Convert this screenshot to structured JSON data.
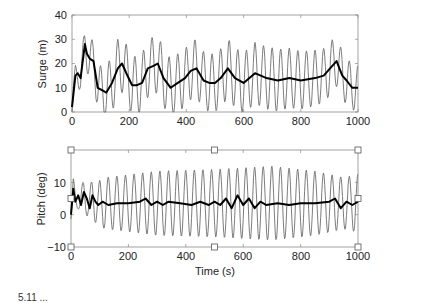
{
  "figure": {
    "caption_partial": "5.11  ..."
  },
  "chart_data": [
    {
      "type": "line",
      "title": "",
      "xlabel": "",
      "ylabel": "Surge (m)",
      "xlim": [
        0,
        1000
      ],
      "ylim": [
        0,
        40
      ],
      "xticks": [
        0,
        200,
        400,
        600,
        800,
        1000
      ],
      "yticks": [
        0,
        10,
        20,
        30,
        40
      ],
      "grid": false,
      "legend": null,
      "frame_px": {
        "left": 72,
        "top": 15,
        "right": 358,
        "bottom": 112
      },
      "series": [
        {
          "name": "surge (oscillatory, thin gray)",
          "color": "#6e6e6e",
          "width": 0.9,
          "kind": "oscillation",
          "period_s": 30,
          "amplitude_m": [
            [
              0,
              4
            ],
            [
              60,
              8
            ],
            [
              150,
              12
            ],
            [
              300,
              12
            ],
            [
              500,
              12
            ],
            [
              700,
              13
            ],
            [
              900,
              11
            ],
            [
              1000,
              9
            ]
          ]
        },
        {
          "name": "surge (mean, thick black)",
          "color": "#000000",
          "width": 2.0,
          "kind": "points",
          "x": [
            0,
            12,
            20,
            30,
            45,
            52,
            62,
            75,
            90,
            105,
            120,
            140,
            160,
            175,
            190,
            210,
            225,
            245,
            265,
            285,
            300,
            320,
            345,
            370,
            395,
            415,
            435,
            460,
            480,
            500,
            520,
            545,
            570,
            600,
            640,
            680,
            720,
            760,
            800,
            850,
            880,
            910,
            925,
            945,
            960,
            980,
            1000
          ],
          "y": [
            2,
            15,
            16,
            14,
            28,
            24,
            22,
            21,
            10,
            9,
            8,
            12,
            18,
            20,
            16,
            11,
            11,
            12,
            18,
            19,
            20,
            14,
            10,
            12,
            14,
            17,
            18,
            13,
            12,
            12,
            14,
            18,
            14,
            12,
            16,
            14,
            13,
            14,
            13,
            14,
            15,
            19,
            21,
            15,
            13,
            10,
            10
          ]
        }
      ]
    },
    {
      "type": "line",
      "title": "",
      "xlabel": "Time (s)",
      "ylabel": "Pitch (deg)",
      "xlim": [
        0,
        1000
      ],
      "ylim": [
        -10,
        20
      ],
      "xticks": [
        0,
        200,
        400,
        600,
        800,
        1000
      ],
      "yticks": [
        -10,
        0,
        10
      ],
      "grid": false,
      "legend": null,
      "frame_px": {
        "left": 71,
        "top": 150,
        "right": 358,
        "bottom": 247
      },
      "selection_handles": true,
      "series": [
        {
          "name": "pitch (oscillatory, thin gray)",
          "color": "#6e6e6e",
          "width": 0.9,
          "kind": "oscillation",
          "period_s": 30,
          "center_deg": 3.5,
          "amplitude_deg": [
            [
              0,
              3
            ],
            [
              50,
              5
            ],
            [
              120,
              8
            ],
            [
              300,
              10
            ],
            [
              500,
              10.5
            ],
            [
              700,
              11.5
            ],
            [
              850,
              10
            ],
            [
              950,
              8
            ],
            [
              1000,
              9
            ]
          ]
        },
        {
          "name": "pitch (mean, thick black)",
          "color": "#000000",
          "width": 2.0,
          "kind": "points",
          "x": [
            0,
            8,
            15,
            25,
            35,
            45,
            55,
            65,
            75,
            85,
            95,
            110,
            130,
            160,
            200,
            240,
            260,
            280,
            300,
            320,
            340,
            380,
            420,
            450,
            480,
            500,
            520,
            540,
            560,
            580,
            600,
            620,
            640,
            660,
            680,
            720,
            760,
            800,
            850,
            900,
            920,
            940,
            960,
            980,
            1000
          ],
          "y": [
            0,
            8,
            4,
            6,
            3,
            7,
            5,
            2,
            6,
            4,
            3,
            4,
            3,
            3.5,
            3.5,
            4,
            5,
            3,
            4,
            3,
            4,
            3.5,
            3,
            4,
            3,
            4,
            3,
            5,
            2,
            6,
            3,
            5,
            2,
            4,
            3,
            3.5,
            3,
            3.5,
            3.5,
            4,
            5,
            2,
            4,
            3,
            4
          ]
        }
      ]
    }
  ],
  "axes_text": {
    "top": {
      "ylabel": "Surge (m)",
      "yticks": [
        "0",
        "10",
        "20",
        "30",
        "40"
      ],
      "xticks": [
        "0",
        "200",
        "400",
        "600",
        "800",
        "1000"
      ]
    },
    "bottom": {
      "ylabel": "Pitch (deg)",
      "yticks": [
        "−10",
        "0",
        "10"
      ],
      "xticks": [
        "0",
        "200",
        "400",
        "600",
        "800",
        "1000"
      ],
      "xlabel": "Time (s)"
    }
  }
}
